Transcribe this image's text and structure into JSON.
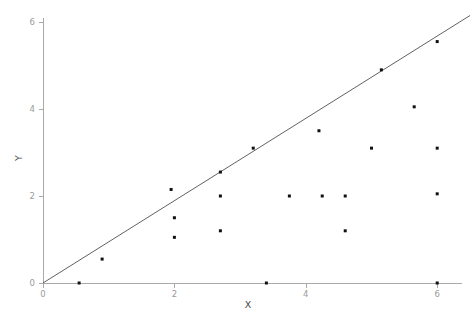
{
  "chart_data": {
    "type": "scatter",
    "title": "",
    "xlabel": "X",
    "ylabel": "Y",
    "xlim": [
      -0.2,
      6.8
    ],
    "ylim": [
      -0.35,
      6.6
    ],
    "xticks": [
      0,
      2,
      4,
      6
    ],
    "yticks": [
      0,
      2,
      4,
      6
    ],
    "xtick_labels": [
      "0",
      "2",
      "4",
      "6"
    ],
    "ytick_labels": [
      "0",
      "2",
      "4",
      "6"
    ],
    "grid": false,
    "legend": null,
    "marker": "square",
    "marker_size": 3,
    "point_color": "#111111",
    "axis_color": "#a9a9a9",
    "tick_label_color": "#9a9a9a",
    "axis_title_color": "#4a4a4a",
    "points": [
      {
        "x": 0.55,
        "y": 0.0
      },
      {
        "x": 0.9,
        "y": 0.55
      },
      {
        "x": 1.95,
        "y": 2.15
      },
      {
        "x": 2.0,
        "y": 1.5
      },
      {
        "x": 2.0,
        "y": 1.05
      },
      {
        "x": 2.7,
        "y": 2.0
      },
      {
        "x": 2.7,
        "y": 2.55
      },
      {
        "x": 2.7,
        "y": 1.2
      },
      {
        "x": 3.2,
        "y": 3.1
      },
      {
        "x": 3.4,
        "y": 0.0
      },
      {
        "x": 3.75,
        "y": 2.0
      },
      {
        "x": 4.2,
        "y": 3.5
      },
      {
        "x": 4.25,
        "y": 2.0
      },
      {
        "x": 4.6,
        "y": 2.0
      },
      {
        "x": 4.6,
        "y": 1.2
      },
      {
        "x": 5.0,
        "y": 3.1
      },
      {
        "x": 5.15,
        "y": 4.9
      },
      {
        "x": 5.65,
        "y": 4.05
      },
      {
        "x": 6.0,
        "y": 5.55
      },
      {
        "x": 6.0,
        "y": 3.1
      },
      {
        "x": 6.0,
        "y": 2.05
      },
      {
        "x": 6.0,
        "y": 0.0
      }
    ],
    "reference_line": {
      "name": "identity-line",
      "x0": 0.0,
      "y0": 0.0,
      "x1": 6.5,
      "y1": 6.15,
      "color": "#4f4f4f"
    }
  }
}
